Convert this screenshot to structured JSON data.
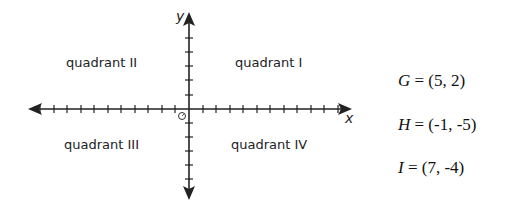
{
  "diagram": {
    "axes": {
      "x_label": "x",
      "y_label": "y",
      "origin_label": "O",
      "x_ticks_each_side": 10,
      "y_ticks_each_side": 5
    },
    "quadrants": [
      {
        "id": "I",
        "label": "quadrant I"
      },
      {
        "id": "II",
        "label": "quadrant II"
      },
      {
        "id": "III",
        "label": "quadrant III"
      },
      {
        "id": "IV",
        "label": "quadrant IV"
      }
    ],
    "points": [
      {
        "name": "G",
        "value": "= (5, 2)"
      },
      {
        "name": "H",
        "value": "= (-1, -5)"
      },
      {
        "name": "I",
        "value": "= (7, -4)"
      }
    ]
  }
}
